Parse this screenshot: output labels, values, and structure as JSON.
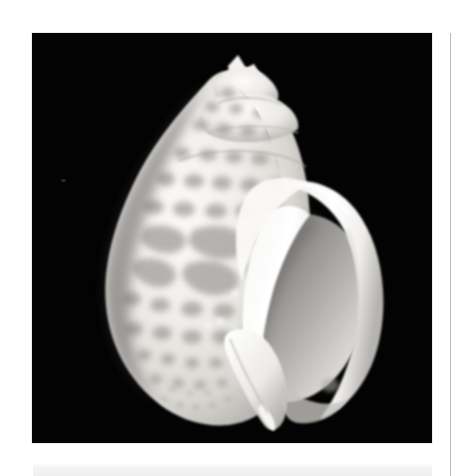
{
  "page": {
    "background_color": "#ffffff",
    "width": 459,
    "height": 476
  },
  "photo_plate": {
    "name": "shell-photograph",
    "subject": "gastropod sea shell",
    "view": "apertural view",
    "background_color": "#030303",
    "shell_color_light": "#f2f0ec",
    "shell_color_mid": "#c9c7c3",
    "shell_spot_color": "#9a9a98",
    "aperture_shadow_color": "#8e8c8a",
    "alt_text": "Black and white photograph of a spotted gastropod shell with a pointed spire and a large open aperture, on a black background"
  },
  "column_rule": {
    "name": "column-rule",
    "color": "#b8b8b8"
  },
  "bottom_band": {
    "name": "bottom-band",
    "color": "#efefef"
  },
  "dust_speck": {
    "name": "dust-speck",
    "color": "#2a2a2a"
  }
}
